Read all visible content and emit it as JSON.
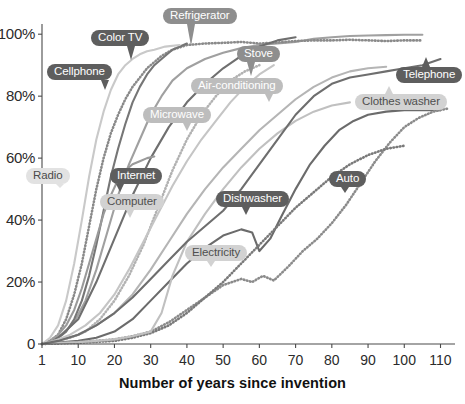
{
  "chart_data": {
    "type": "line",
    "title": "",
    "xlabel": "Number of years since invention",
    "ylabel": "",
    "xticks": [
      "1",
      "10",
      "20",
      "30",
      "40",
      "50",
      "60",
      "70",
      "80",
      "90",
      "100",
      "110"
    ],
    "xtickvalues": [
      1,
      10,
      20,
      30,
      40,
      50,
      60,
      70,
      80,
      90,
      100,
      110
    ],
    "yticks": [
      "0",
      "20%",
      "40%",
      "60%",
      "80%",
      "100%"
    ],
    "ytickvalues": [
      0,
      20,
      40,
      60,
      80,
      100
    ],
    "xlim": [
      1,
      114
    ],
    "ylim": [
      0,
      102
    ],
    "grid": false,
    "legend_position": "inline-labels",
    "series": [
      {
        "name": "Refrigerator",
        "color": "#a0a0a0",
        "style": "solid",
        "label_pill": "mid",
        "x": [
          1,
          3,
          6,
          9,
          12,
          15,
          18,
          21,
          24,
          27,
          30,
          33,
          36,
          40,
          45,
          50,
          55,
          60,
          65,
          70,
          75,
          80,
          85,
          90,
          95,
          100,
          105
        ],
        "y": [
          0,
          1,
          3,
          7,
          14,
          24,
          36,
          48,
          58,
          66,
          74,
          80,
          85,
          89,
          92,
          94,
          95.5,
          96.5,
          97,
          97.5,
          98.5,
          99,
          99.4,
          99.6,
          99.7,
          99.8,
          99.8
        ]
      },
      {
        "name": "Color TV",
        "color": "#8a8a8a",
        "style": "dotted",
        "label_pill": "dark",
        "x": [
          1,
          3,
          5,
          7,
          9,
          11,
          13,
          15,
          17,
          19,
          21,
          23,
          25,
          27,
          29,
          31,
          33,
          36,
          40,
          45,
          50,
          55,
          60,
          65,
          70,
          75,
          80,
          85,
          90,
          95,
          100,
          105
        ],
        "y": [
          0,
          1,
          3,
          8,
          16,
          26,
          38,
          50,
          60,
          68,
          74,
          79,
          83,
          86,
          89,
          91,
          93,
          95,
          96.5,
          97,
          97.2,
          97.5,
          97,
          97.3,
          97.8,
          98,
          98,
          98.2,
          98,
          97.8,
          98,
          98
        ]
      },
      {
        "name": "Cellphone",
        "color": "#767676",
        "style": "solid",
        "label_pill": "dark",
        "x": [
          1,
          3,
          5,
          7,
          9,
          11,
          13,
          15,
          17,
          19,
          21,
          23,
          25,
          27,
          29,
          31,
          33,
          36,
          40
        ],
        "y": [
          0,
          1,
          2,
          4,
          8,
          14,
          22,
          32,
          43,
          54,
          63,
          71,
          78,
          83,
          87,
          90,
          92,
          95,
          97
        ]
      },
      {
        "name": "Air-conditioning",
        "color": "#b5b5b5",
        "style": "solid",
        "label_pill": "light",
        "x": [
          1,
          5,
          10,
          15,
          20,
          25,
          30,
          35,
          40,
          45,
          50,
          55,
          60,
          65,
          70,
          75,
          80,
          85,
          90,
          95
        ],
        "y": [
          0,
          1,
          3,
          6,
          10,
          16,
          24,
          33,
          42,
          50,
          57,
          63,
          69,
          74,
          79,
          83,
          86,
          88,
          89,
          89.5
        ]
      },
      {
        "name": "Stove",
        "color": "#6f6f6f",
        "style": "solid",
        "label_pill": "mid",
        "x": [
          1,
          5,
          10,
          15,
          20,
          25,
          30,
          35,
          40,
          45,
          50,
          55,
          60,
          65,
          70
        ],
        "y": [
          0,
          2,
          8,
          20,
          34,
          48,
          60,
          70,
          78,
          84,
          89,
          93,
          96,
          98,
          99
        ]
      },
      {
        "name": "Microwave",
        "color": "#b2b2b2",
        "style": "dotted",
        "label_pill": "light",
        "x": [
          1,
          4,
          8,
          12,
          16,
          20,
          24,
          28,
          32,
          36,
          40,
          44,
          48,
          52,
          56,
          60
        ],
        "y": [
          0,
          1,
          2,
          4,
          8,
          14,
          22,
          32,
          44,
          56,
          66,
          74,
          80,
          85,
          88,
          90
        ]
      },
      {
        "name": "Internet",
        "color": "#9a9a9a",
        "style": "solid",
        "label_pill": "dark",
        "x": [
          1,
          3,
          5,
          7,
          9,
          11,
          13,
          15,
          17,
          19,
          21,
          23,
          25,
          27,
          29,
          31
        ],
        "y": [
          0,
          1,
          3,
          6,
          11,
          18,
          26,
          34,
          42,
          48,
          53,
          56,
          58,
          59,
          60,
          60.5
        ]
      },
      {
        "name": "Computer",
        "color": "#c5c5c5",
        "style": "solid",
        "label_pill": "palemid",
        "x": [
          1,
          4,
          8,
          12,
          16,
          20,
          24,
          28,
          32,
          36,
          40,
          44,
          48,
          52,
          56,
          60,
          64
        ],
        "y": [
          0,
          1,
          3,
          6,
          10,
          16,
          24,
          33,
          42,
          51,
          59,
          66,
          72,
          78,
          83,
          87,
          90
        ]
      },
      {
        "name": "Radio",
        "color": "#c9c9c9",
        "style": "solid",
        "label_pill": "pale",
        "x": [
          1,
          3,
          5,
          7,
          9,
          11,
          13,
          15,
          17,
          19,
          21,
          23,
          25,
          27,
          29,
          31,
          34,
          38
        ],
        "y": [
          0,
          2,
          6,
          14,
          26,
          40,
          54,
          66,
          75,
          82,
          87,
          90,
          92,
          93.5,
          94.5,
          95,
          96,
          96.5
        ]
      },
      {
        "name": "Dishwasher",
        "color": "#6b6b6b",
        "style": "solid",
        "label_pill": "dark",
        "x": [
          1,
          5,
          10,
          15,
          20,
          25,
          30,
          35,
          40,
          45,
          50,
          55,
          58,
          60,
          63,
          66,
          70,
          74,
          78,
          82,
          86,
          90,
          95,
          100,
          105,
          110
        ],
        "y": [
          0,
          0.5,
          1,
          2,
          4,
          8,
          14,
          20,
          26,
          31,
          35,
          37,
          36,
          30,
          34,
          41,
          50,
          58,
          64,
          69,
          72,
          74,
          75,
          75.5,
          75.5,
          75.5
        ]
      },
      {
        "name": "Electricity",
        "color": "#8b8b8b",
        "style": "dotted",
        "label_pill": "palemid",
        "x": [
          1,
          5,
          10,
          15,
          20,
          25,
          30,
          35,
          40,
          45,
          50,
          55,
          58,
          61,
          64,
          68,
          72,
          76,
          80,
          84,
          88,
          92,
          96,
          100,
          104,
          108,
          112
        ],
        "y": [
          0,
          0.3,
          0.6,
          1,
          1.5,
          2.5,
          4,
          7,
          11,
          15,
          19,
          21,
          20,
          22,
          20.5,
          25,
          30,
          34,
          39,
          45,
          52,
          59,
          65,
          70,
          73,
          75,
          76
        ]
      },
      {
        "name": "Auto",
        "color": "#7a7a7a",
        "style": "dotted",
        "label_pill": "dark",
        "x": [
          1,
          5,
          10,
          15,
          20,
          25,
          30,
          35,
          40,
          45,
          50,
          55,
          60,
          65,
          70,
          75,
          80,
          85,
          90,
          95,
          100
        ],
        "y": [
          0,
          0.2,
          0.4,
          0.7,
          1,
          2,
          3.5,
          6,
          10,
          15,
          20,
          26,
          32,
          38,
          44,
          49,
          54,
          58,
          61,
          63,
          64
        ]
      },
      {
        "name": "Clothes washer",
        "color": "#c0c0c0",
        "style": "solid",
        "label_pill": "palemid",
        "x": [
          1,
          5,
          10,
          15,
          20,
          25,
          30,
          33,
          36,
          40,
          45,
          50,
          55,
          60,
          65,
          70,
          75,
          80,
          85
        ],
        "y": [
          0,
          0.3,
          0.6,
          1,
          1.5,
          2.5,
          4,
          10,
          22,
          33,
          42,
          50,
          57,
          63,
          68,
          72,
          75,
          77,
          78
        ]
      },
      {
        "name": "Telephone",
        "color": "#6e6e6e",
        "style": "solid",
        "label_pill": "dark",
        "x": [
          1,
          5,
          10,
          15,
          20,
          25,
          30,
          35,
          40,
          45,
          50,
          55,
          60,
          65,
          70,
          75,
          80,
          85,
          90,
          95,
          100,
          105,
          110
        ],
        "y": [
          0,
          1,
          3,
          6,
          10,
          15,
          21,
          27,
          33,
          38,
          43,
          50,
          58,
          66,
          74,
          80,
          84,
          86,
          87,
          88,
          89,
          90,
          92
        ]
      }
    ],
    "labels": [
      {
        "text": "Refrigerator",
        "pill": "mid",
        "left": 163,
        "top": 8,
        "pointer": {
          "dx": 28,
          "dy": 22
        }
      },
      {
        "text": "Color TV",
        "pill": "dark",
        "left": 91,
        "top": 30,
        "pointer": {
          "dx": 40,
          "dy": 14
        }
      },
      {
        "text": "Cellphone",
        "pill": "dark",
        "left": 47,
        "top": 64,
        "pointer": {
          "dx": 58,
          "dy": 10
        }
      },
      {
        "text": "Stove",
        "pill": "mid",
        "left": 237,
        "top": 46,
        "pointer": {
          "dx": 14,
          "dy": 14
        }
      },
      {
        "text": "Air-conditioning",
        "pill": "light",
        "left": 191,
        "top": 78,
        "pointer": {
          "dx": 78,
          "dy": 8
        }
      },
      {
        "text": "Telephone",
        "pill": "dark",
        "left": 396,
        "top": 67,
        "pointer": {
          "dx": 30,
          "dy": -10
        }
      },
      {
        "text": "Clothes washer",
        "pill": "palemid",
        "left": 355,
        "top": 94,
        "pointer": {
          "dx": 34,
          "dy": -8
        }
      },
      {
        "text": "Microwave",
        "pill": "light",
        "left": 143,
        "top": 107,
        "pointer": {
          "dx": 44,
          "dy": 8
        }
      },
      {
        "text": "Radio",
        "pill": "pale",
        "left": 26,
        "top": 168,
        "pointer": {
          "dx": 34,
          "dy": 4
        }
      },
      {
        "text": "Internet",
        "pill": "dark",
        "left": 110,
        "top": 168,
        "pointer": {
          "dx": 10,
          "dy": 8
        }
      },
      {
        "text": "Computer",
        "pill": "palemid",
        "left": 100,
        "top": 194,
        "pointer": {
          "dx": 30,
          "dy": 8
        }
      },
      {
        "text": "Dishwasher",
        "pill": "dark",
        "left": 216,
        "top": 191,
        "pointer": {
          "dx": 30,
          "dy": 8
        }
      },
      {
        "text": "Electricity",
        "pill": "palemid",
        "left": 185,
        "top": 245,
        "pointer": {
          "dx": 26,
          "dy": 6
        }
      },
      {
        "text": "Auto",
        "pill": "dark",
        "left": 329,
        "top": 171,
        "pointer": {
          "dx": 16,
          "dy": 6
        }
      }
    ]
  },
  "axes": {
    "x_title": "Number of years since invention"
  }
}
